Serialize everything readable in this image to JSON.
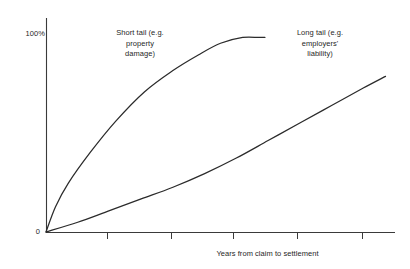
{
  "chart_data": {
    "type": "line",
    "title": "",
    "subtitle": "",
    "xlabel": "Years from claim to settlement",
    "ylabel": "",
    "grid": false,
    "legend_position": "inline-annotations",
    "xlim": [
      0,
      5.5
    ],
    "ylim": [
      0,
      110
    ],
    "x_tick_labels": [
      "",
      "",
      "",
      "",
      ""
    ],
    "x_ticks": [
      1,
      2,
      3,
      4,
      5
    ],
    "y_ticks": [
      0,
      100
    ],
    "y_tick_labels": [
      "0",
      "100%"
    ],
    "series": [
      {
        "name": "Short tail (e.g. property damage)",
        "color": "#2b2b2b",
        "x": [
          0,
          0.15,
          0.35,
          0.7,
          1.1,
          1.55,
          2.0,
          2.4,
          2.75,
          3.1,
          3.35,
          3.45
        ],
        "values": [
          0,
          13,
          25,
          41,
          57,
          72,
          83,
          91,
          97,
          100,
          100,
          100
        ]
      },
      {
        "name": "Long tail (e.g. employers' liability)",
        "color": "#2b2b2b",
        "x": [
          0,
          0.5,
          1.0,
          1.5,
          2.0,
          2.5,
          3.0,
          3.5,
          4.0,
          4.5,
          5.0,
          5.35
        ],
        "values": [
          0,
          5,
          11,
          17,
          23,
          30,
          38,
          47,
          56,
          65,
          74,
          80
        ]
      }
    ],
    "annotations": [
      {
        "id": "short-tail",
        "lines": [
          "Short tail (e.g.",
          "property",
          "damage)"
        ],
        "text": "Short tail (e.g.\nproperty\ndamage)"
      },
      {
        "id": "long-tail",
        "lines": [
          "Long tail (e.g.",
          "employers'",
          "liability)"
        ],
        "text": "Long tail (e.g.\nemployers'\nliability)"
      }
    ]
  },
  "axes": {
    "y_top_label": "100%",
    "y_zero_label": "0",
    "x_title": "Years from claim to settlement"
  },
  "colors": {
    "background": "#ffffff",
    "axis": "#3a3a3a",
    "curve": "#2b2b2b",
    "text": "#1f1f1f"
  }
}
